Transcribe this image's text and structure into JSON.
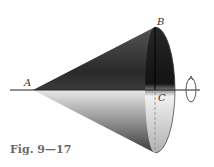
{
  "figure": {
    "caption": "Fig. 9—17",
    "labels": {
      "apex": "A",
      "rim_top": "B",
      "base_center": "C"
    },
    "colors": {
      "dark": "#1a1a1a",
      "light": "#f2f2f2",
      "axis": "#222222",
      "caption": "#6a6a6a"
    }
  }
}
